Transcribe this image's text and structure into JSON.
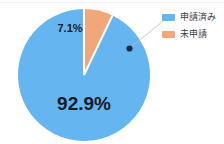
{
  "chart_data": {
    "type": "pie",
    "title": "",
    "categories": [
      "申請済み",
      "未申請"
    ],
    "values": [
      92.9,
      7.1
    ],
    "value_unit": "%",
    "data_labels": [
      "92.9%",
      "7.1%"
    ],
    "colors": [
      "#64B5F0",
      "#F0A878"
    ],
    "legend_position": "right",
    "grid": false,
    "start_angle_deg": 0,
    "direction": "counterclockwise",
    "annotation": {
      "marker": "callout-dot",
      "marker_color": "#1b2a4a",
      "leader_line_color": "#b9bcc4"
    }
  },
  "legend": {
    "items": [
      {
        "label": "申請済み",
        "color": "#64B5F0",
        "swatch_name": "legend-swatch-applied"
      },
      {
        "label": "未申請",
        "color": "#F0A878",
        "swatch_name": "legend-swatch-unapplied"
      }
    ]
  },
  "labels": {
    "major": "92.9%",
    "minor": "7.1%"
  }
}
